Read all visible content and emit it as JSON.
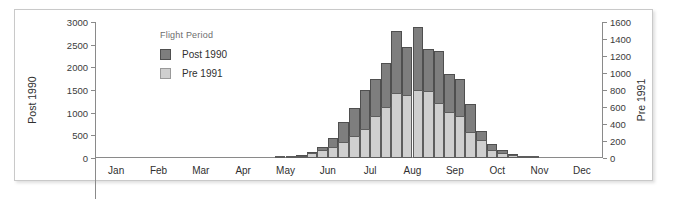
{
  "figure": {
    "legend_title": "Flight Period"
  },
  "chart_data": {
    "type": "bar",
    "title": "",
    "subtitle": "",
    "xlabel": "",
    "ylabel": "Post 1990",
    "y2label": "Pre 1991",
    "grid": false,
    "legend_position": "inside-top-left",
    "legend_title": "Flight Period",
    "bin": "week",
    "x_tick_labels": [
      "Jan",
      "Feb",
      "Mar",
      "Apr",
      "May",
      "Jun",
      "Jul",
      "Aug",
      "Sep",
      "Oct",
      "Nov",
      "Dec"
    ],
    "x_minor_ticks_per_month": 4,
    "ylim": [
      0,
      3000
    ],
    "y_ticks": [
      0,
      500,
      1000,
      1500,
      2000,
      2500,
      3000
    ],
    "y2lim": [
      0,
      1600
    ],
    "y2_ticks": [
      0,
      200,
      400,
      600,
      800,
      1000,
      1200,
      1400,
      1600
    ],
    "colors": {
      "post_1990": "#7e7e7e",
      "pre_1991": "#cfcfcf",
      "axis": "#8a8a8a",
      "text": "#2f2f2f",
      "frame": "#c9c9c9",
      "background": "#ffffff"
    },
    "x": [
      "Jan w1",
      "Jan w2",
      "Jan w3",
      "Jan w4",
      "Feb w1",
      "Feb w2",
      "Feb w3",
      "Feb w4",
      "Mar w1",
      "Mar w2",
      "Mar w3",
      "Mar w4",
      "Apr w1",
      "Apr w2",
      "Apr w3",
      "Apr w4",
      "May w1",
      "May w2",
      "May w3",
      "May w4",
      "Jun w1",
      "Jun w2",
      "Jun w3",
      "Jun w4",
      "Jul w1",
      "Jul w2",
      "Jul w3",
      "Jul w4",
      "Aug w1",
      "Aug w2",
      "Aug w3",
      "Aug w4",
      "Sep w1",
      "Sep w2",
      "Sep w3",
      "Sep w4",
      "Oct w1",
      "Oct w2",
      "Oct w3",
      "Oct w4",
      "Nov w1",
      "Nov w2",
      "Nov w3",
      "Nov w4",
      "Dec w1",
      "Dec w2",
      "Dec w3",
      "Dec w4"
    ],
    "series": [
      {
        "name": "Post 1990",
        "axis": "left",
        "color": "#7e7e7e",
        "values": [
          0,
          0,
          0,
          0,
          0,
          0,
          0,
          0,
          0,
          0,
          0,
          0,
          0,
          0,
          0,
          0,
          0,
          20,
          40,
          60,
          130,
          250,
          450,
          800,
          1100,
          1500,
          1750,
          2100,
          2800,
          2450,
          2900,
          2400,
          2350,
          1850,
          1750,
          1200,
          600,
          300,
          170,
          90,
          30,
          10,
          0,
          0,
          0,
          0,
          0,
          0
        ]
      },
      {
        "name": "Pre 1991",
        "axis": "right",
        "color": "#cfcfcf",
        "values": [
          0,
          0,
          0,
          0,
          0,
          0,
          0,
          0,
          0,
          0,
          0,
          0,
          0,
          0,
          0,
          0,
          0,
          8,
          18,
          28,
          55,
          95,
          130,
          185,
          255,
          340,
          490,
          600,
          760,
          740,
          800,
          790,
          650,
          540,
          500,
          310,
          210,
          90,
          60,
          35,
          15,
          5,
          0,
          0,
          0,
          0,
          0,
          0
        ]
      }
    ]
  }
}
